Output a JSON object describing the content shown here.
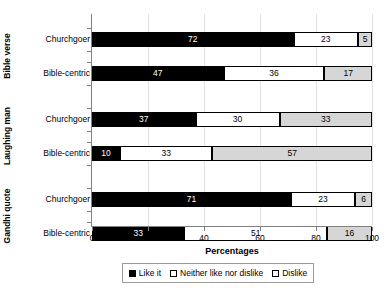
{
  "chart_data": {
    "type": "bar",
    "orientation": "horizontal",
    "stacked": true,
    "title": "",
    "xlabel": "Percentages",
    "ylabel": "",
    "xlim": [
      0,
      100
    ],
    "xticks": [
      0,
      20,
      40,
      60,
      80,
      100
    ],
    "grid": true,
    "legend_position": "bottom",
    "series": [
      {
        "name": "Like it",
        "color": "#000000"
      },
      {
        "name": "Neither like nor dislike",
        "color": "#ffffff"
      },
      {
        "name": "Dislike",
        "color": "#d6d6d6"
      }
    ],
    "groups": [
      {
        "label": "Bible verse",
        "rows": [
          {
            "category": "Churchgoer",
            "values": [
              72,
              23,
              5
            ]
          },
          {
            "category": "Bible-centric",
            "values": [
              47,
              36,
              17
            ]
          }
        ]
      },
      {
        "label": "Laughing man",
        "rows": [
          {
            "category": "Churchgoer",
            "values": [
              37,
              30,
              33
            ]
          },
          {
            "category": "Bible-centric",
            "values": [
              10,
              33,
              57
            ]
          }
        ]
      },
      {
        "label": "Gandhi quote",
        "rows": [
          {
            "category": "Churchgoer",
            "values": [
              71,
              23,
              6
            ]
          },
          {
            "category": "Bible-centric",
            "values": [
              33,
              51,
              16
            ]
          }
        ]
      }
    ]
  }
}
